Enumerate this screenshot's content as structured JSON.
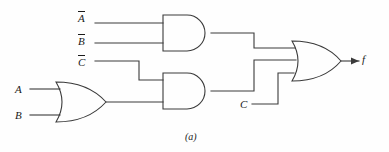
{
  "figure": {
    "caption": "(a)",
    "type": "logic-circuit-diagram",
    "background_color": "#fefefe",
    "line_color": "#3a3a3a"
  },
  "inputs": [
    {
      "id": "not-a",
      "base": "A",
      "overbar": true,
      "label": "A̅",
      "x": 82,
      "y": 17
    },
    {
      "id": "not-b",
      "base": "B",
      "overbar": true,
      "label": "B̅",
      "x": 82,
      "y": 40
    },
    {
      "id": "not-c",
      "base": "C",
      "overbar": true,
      "label": "C̅",
      "x": 82,
      "y": 61
    },
    {
      "id": "in-a",
      "base": "A",
      "overbar": false,
      "label": "A",
      "x": 18,
      "y": 91
    },
    {
      "id": "in-b",
      "base": "B",
      "overbar": false,
      "label": "B",
      "x": 18,
      "y": 113
    },
    {
      "id": "in-c",
      "base": "C",
      "overbar": false,
      "label": "C",
      "x": 244,
      "y": 104
    }
  ],
  "output": {
    "id": "out-f",
    "label": "f",
    "x": 364,
    "y": 59
  },
  "gates": [
    {
      "id": "and-top",
      "type": "AND",
      "inputs": [
        "A̅",
        "B̅"
      ],
      "x": 163,
      "y": 15,
      "w": 48,
      "h": 36
    },
    {
      "id": "and-lower",
      "type": "AND",
      "inputs": [
        "C̅",
        "A+B"
      ],
      "x": 163,
      "y": 73,
      "w": 48,
      "h": 36
    },
    {
      "id": "or-left",
      "type": "OR",
      "inputs": [
        "A",
        "B"
      ],
      "x": 56,
      "y": 82,
      "w": 50,
      "h": 40
    },
    {
      "id": "or-out",
      "type": "OR",
      "inputs": [
        "and-top",
        "and-lower",
        "C"
      ],
      "x": 292,
      "y": 41,
      "w": 49,
      "h": 40
    }
  ],
  "expression": "f = A̅B̅ + C̅(A+B) + C"
}
